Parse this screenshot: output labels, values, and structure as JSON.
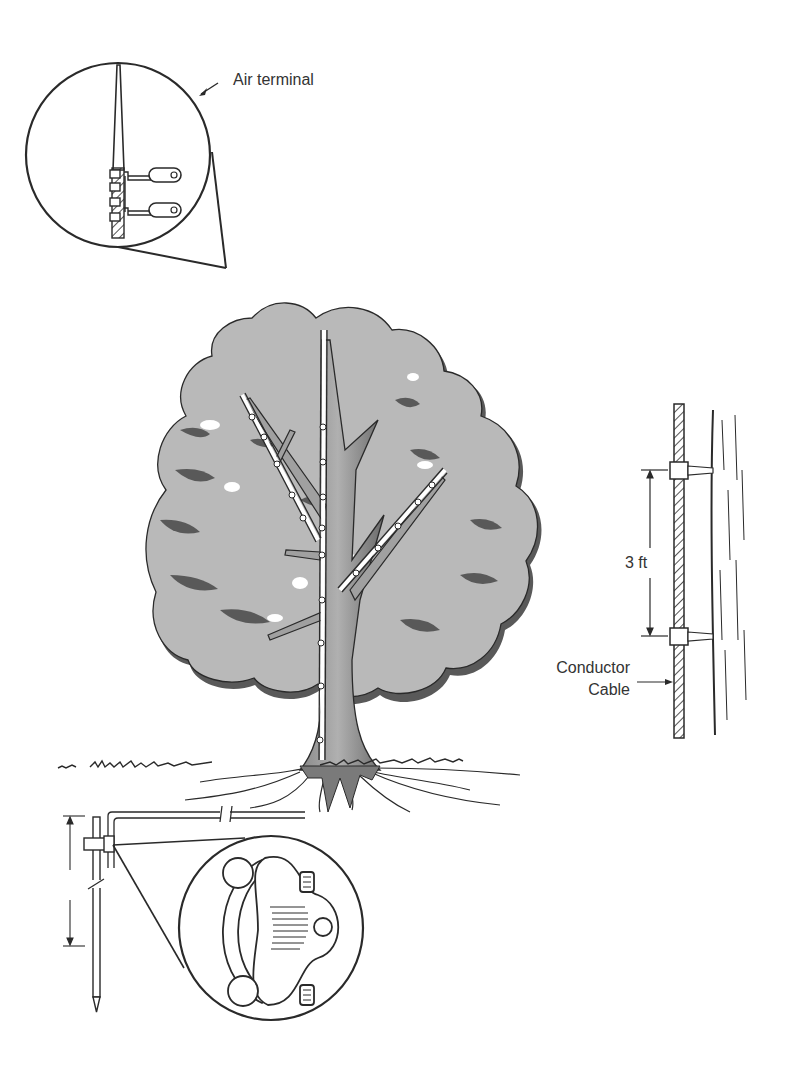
{
  "figure": {
    "labels": {
      "air_terminal": "Air terminal",
      "spacing": "3 ft",
      "conductor_line1": "Conductor",
      "conductor_line2": "Cable"
    },
    "components": [
      {
        "id": "air-terminal-detail",
        "name": "Air terminal",
        "type": "inset-circle"
      },
      {
        "id": "tree",
        "name": "Tree with lightning protection conductors",
        "type": "illustration"
      },
      {
        "id": "conductor-detail",
        "name": "Conductor cable fastened to trunk at 3 ft spacing",
        "type": "side-detail"
      },
      {
        "id": "ground-rod",
        "name": "Ground rod",
        "type": "illustration"
      },
      {
        "id": "clamp-detail",
        "name": "Ground clamp",
        "type": "inset-circle"
      }
    ],
    "colors": {
      "ink": "#2a2a2a",
      "canopy": "#b9b9b9",
      "canopy_shadow": "#595959",
      "trunk_light": "#a8a8a8",
      "trunk_dark": "#6e6e6e",
      "background": "#ffffff"
    }
  }
}
